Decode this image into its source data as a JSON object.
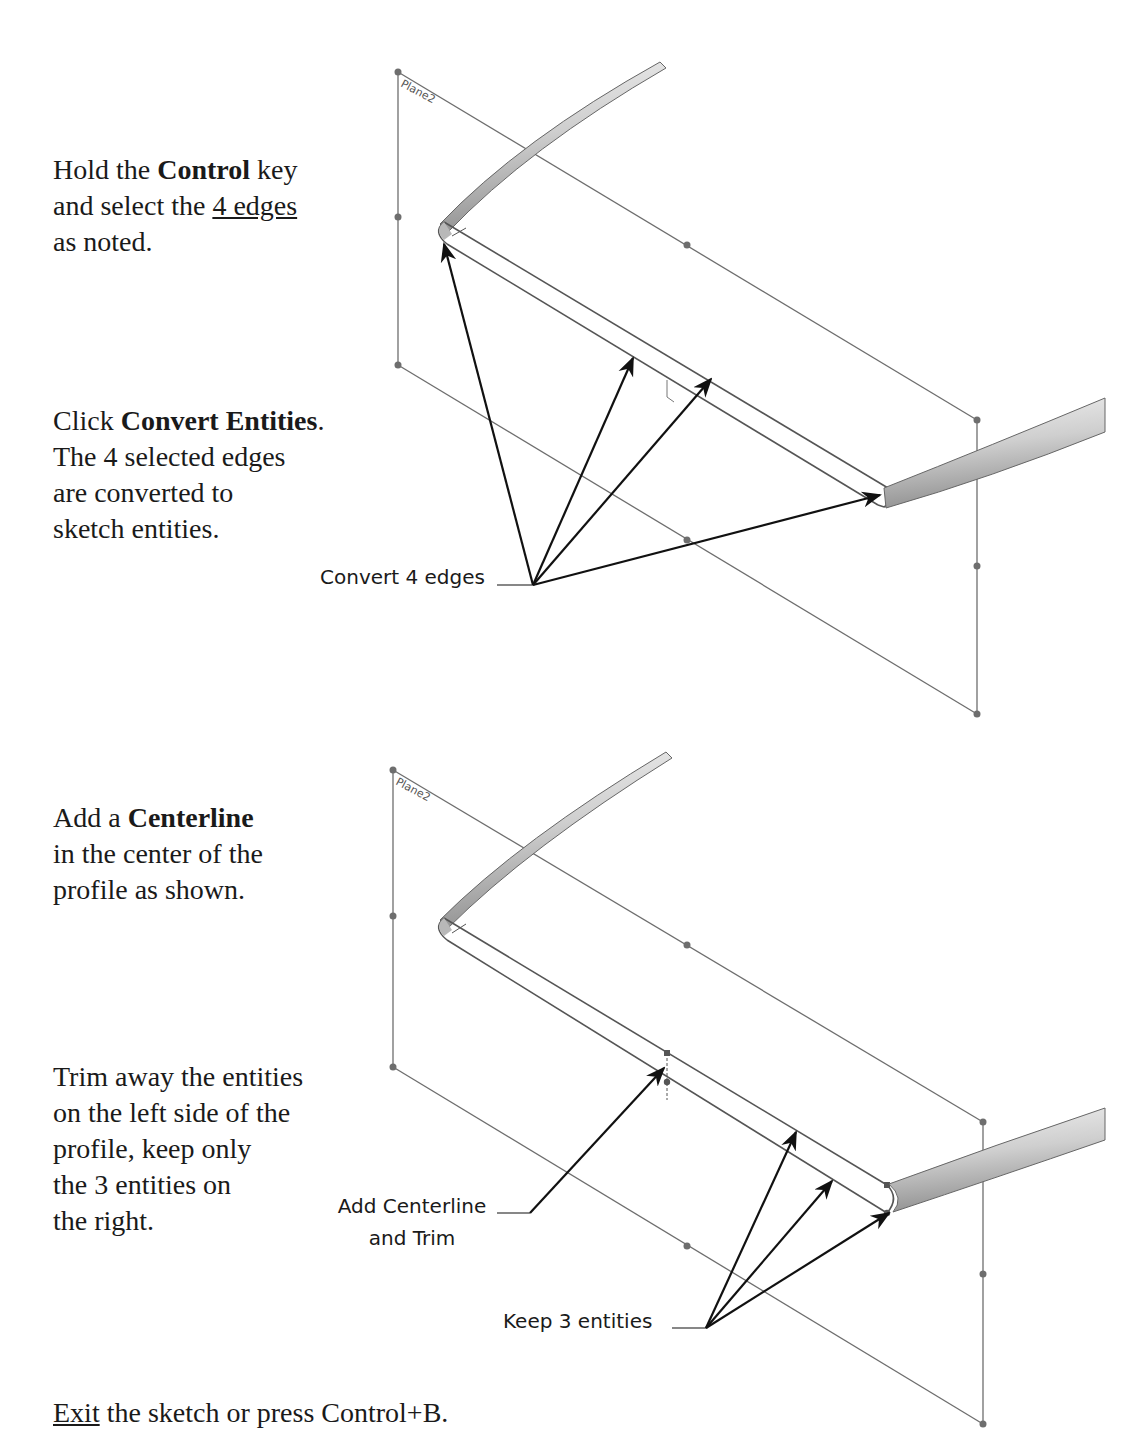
{
  "step1": {
    "instruction_a": {
      "prefix": "Hold the ",
      "bold": "Control",
      "suffix": " key",
      "line2_prefix": "and select the ",
      "line2_underline": "4 edges",
      "line3": "as noted."
    },
    "instruction_b": {
      "prefix": "Click ",
      "bold": "Convert Entities",
      "suffix": ".",
      "line2": "The 4 selected edges",
      "line3": "are converted to",
      "line4": "sketch entities."
    },
    "plane_label": "Plane2",
    "callout": "Convert 4 edges"
  },
  "step2": {
    "instruction_a": {
      "prefix": "Add a ",
      "bold": "Centerline",
      "line2": "in the center of the",
      "line3": "profile as shown."
    },
    "instruction_b": {
      "line1": "Trim away the entities",
      "line2": "on the left side of the",
      "line3": "profile, keep only",
      "line4": "the 3 entities on",
      "line5": "the right."
    },
    "plane_label": "Plane2",
    "callout_centerline_line1": "Add Centerline",
    "callout_centerline_line2": "and Trim",
    "callout_keep": "Keep 3 entities"
  },
  "footer": {
    "underline": "Exit",
    "rest": " the sketch or press Control+B."
  },
  "colors": {
    "text": "#1a1a1a",
    "plane_line": "#6e6e6e",
    "arrow": "#111111",
    "tube_light": "#f2f2f2",
    "tube_dark": "#9a9a9a"
  }
}
